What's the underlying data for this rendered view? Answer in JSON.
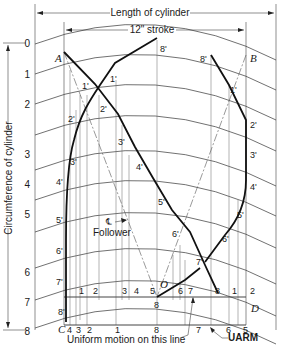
{
  "diagram": {
    "type": "cylindrical-cam-development",
    "dimensions": {
      "length_label": "Length of cylinder",
      "stroke_label": "12\" stroke",
      "circumference_label": "Circumference of cylinder"
    },
    "points": {
      "A": "A",
      "B": "B",
      "C": "C",
      "D": "D",
      "O": "O"
    },
    "left_scale": [
      "0",
      "1",
      "2",
      "3",
      "4",
      "5",
      "6",
      "7",
      "8"
    ],
    "left_curve_labels": [
      "1'",
      "2'",
      "3'",
      "4'",
      "5'",
      "6'",
      "7'",
      "8'"
    ],
    "uniform_line_labels_top": [
      "1",
      "2",
      "3",
      "4",
      "5",
      "6",
      "7",
      "8",
      "1",
      "2"
    ],
    "uniform_line_labels_bottom": [
      "4",
      "3",
      "2",
      "1",
      "8",
      "7",
      "6",
      "5"
    ],
    "center_bottom_label": "8",
    "diagonal_labels": [
      "1'",
      "2'",
      "3'",
      "4'",
      "5'",
      "6'",
      "7'",
      "8'"
    ],
    "right_curve_labels": [
      "8'",
      "1'",
      "2'",
      "3'",
      "4'",
      "5'",
      "6'",
      "7'"
    ],
    "follower_label": "Follower",
    "centerline_symbol": "℄",
    "annotations": {
      "uniform_motion": "Uniform motion on this line",
      "uarm": "UARM"
    }
  }
}
